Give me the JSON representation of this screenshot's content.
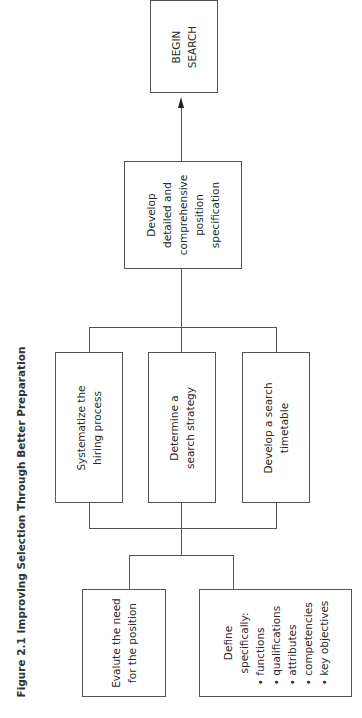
{
  "figure": {
    "title": "Figure 2.1 Improving Selection Through Better Preparation",
    "orientation": "rotated 90° counterclockwise"
  },
  "nodes": {
    "evaluate": {
      "lines": [
        "Evalute the need",
        "for the position"
      ]
    },
    "define": {
      "heading": [
        "Define",
        "specifically:"
      ],
      "items": [
        "• functions",
        "• qualifications",
        "• attributes",
        "• competencies",
        "• key objectives"
      ]
    },
    "systematize": {
      "lines": [
        "Systematize the",
        "hiring process"
      ]
    },
    "determine": {
      "lines": [
        "Determine a",
        "search strategy"
      ]
    },
    "timetable": {
      "lines": [
        "Develop a search",
        "timetable"
      ]
    },
    "specification": {
      "lines": [
        "Develop",
        "detailed and",
        "comprehensive",
        "position",
        "specification"
      ]
    },
    "begin": {
      "lines": [
        "BEGIN",
        "SEARCH"
      ]
    }
  },
  "colors": {
    "line": "#555555",
    "text": "#2a2a2a",
    "background": "#ffffff"
  }
}
